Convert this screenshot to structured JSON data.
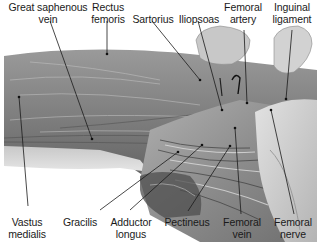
{
  "figure": {
    "colors": {
      "background": "#ffffff",
      "label_text": "#1a1a1a",
      "leader_line": "#1a1a1a",
      "muscle_mid": "#8a8a8a",
      "muscle_dark": "#5a5a5a",
      "tissue_light": "#d8d8d8"
    }
  },
  "labels": {
    "great_saphenous_vein": "Great saphenous\nvein",
    "rectus_femoris": "Rectus\nfemoris",
    "sartorius": "Sartorius",
    "iliopsoas": "Iliopsoas",
    "femoral_artery": "Femoral\nartery",
    "inguinal_ligament": "Inguinal\nligament",
    "vastus_medialis": "Vastus\nmedialis",
    "gracilis": "Gracilis",
    "adductor_longus": "Adductor\nlongus",
    "pectineus": "Pectineus",
    "femoral_vein": "Femoral\nvein",
    "femoral_nerve": "Femoral\nnerve"
  }
}
